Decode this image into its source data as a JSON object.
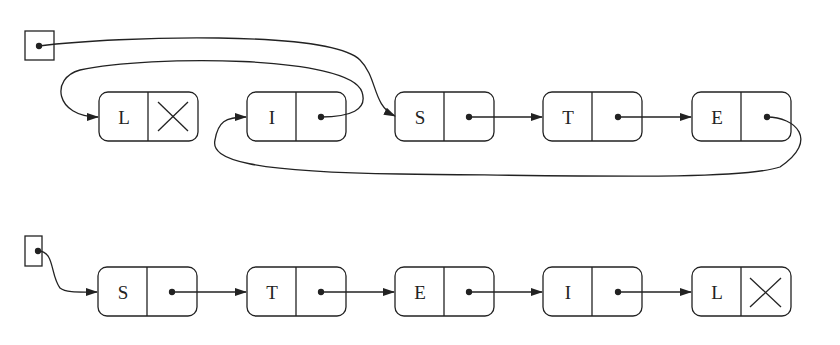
{
  "diagram": {
    "top_list": {
      "head_pointer": "head",
      "nodes": [
        {
          "label": "L",
          "next": null
        },
        {
          "label": "I",
          "next": "L"
        },
        {
          "label": "S",
          "next": "T"
        },
        {
          "label": "T",
          "next": "E"
        },
        {
          "label": "E",
          "next": "I"
        }
      ],
      "head_points_to": "S"
    },
    "bottom_list": {
      "head_pointer": "head",
      "nodes": [
        {
          "label": "S",
          "next": "T"
        },
        {
          "label": "T",
          "next": "E"
        },
        {
          "label": "E",
          "next": "I"
        },
        {
          "label": "I",
          "next": "L"
        },
        {
          "label": "L",
          "next": null
        }
      ],
      "head_points_to": "S"
    },
    "colors": {
      "stroke": "#222222",
      "background": "#ffffff"
    }
  }
}
